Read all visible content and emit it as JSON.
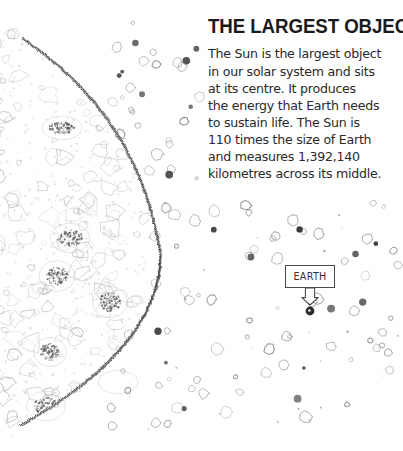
{
  "page": {
    "background_color": "#ffffff",
    "width": 403,
    "height": 451
  },
  "article": {
    "headline": "THE LARGEST OBJECT",
    "body": "The Sun is the largest object\nin our solar system and sits\nat its centre. It produces\nthe energy that Earth needs\nto sustain life. The Sun is\n110 times the size of Earth\nand measures 1,392,140\nkilometres across its middle.",
    "body_lines": [
      "The Sun is the largest object",
      "in our solar system and sits",
      "at its centre. It produces",
      "the energy that Earth needs",
      "to sustain life. The Sun is",
      "110 times the size of Earth",
      "and measures 1,392,140",
      "kilometres across its middle."
    ],
    "facts": {
      "size_vs_earth": "110 times the size of Earth",
      "diameter_km": "1,392,140",
      "diameter_unit": "kilometres"
    },
    "text_color": "#2a2a2a",
    "headline_color": "#1b1b1b"
  },
  "illustration": {
    "type": "hand-drawn-astronomy-diagram",
    "sun": {
      "label": "sun",
      "description": "large cropped sphere at left edge with wavy flame-like limb and stippled surface texture",
      "limb_color": "#3d3d3d",
      "texture_color": "#b9b9b9",
      "sunspot_color": "#555555",
      "arc_start": [
        22,
        38
      ],
      "arc_apex": [
        161,
        256
      ],
      "arc_end": [
        20,
        426
      ]
    },
    "starfield": {
      "label": "starfield",
      "description": "scattered hand-drawn hollow and filled circles of varying size",
      "hollow_color": "#8a8a8a",
      "filled_color": "#3a3a3a",
      "count": 132,
      "bounds": [
        150,
        20,
        400,
        432
      ]
    }
  },
  "callout": {
    "label_text": "EARTH",
    "border_color": "#4a4a4a",
    "text_color": "#333333",
    "box": {
      "x": 285,
      "y": 265,
      "width": 50,
      "height": 23
    },
    "arrow": {
      "direction": "down",
      "style": "hollow-outline",
      "from": [
        310,
        288
      ],
      "to": [
        310,
        305
      ],
      "color": "#4a4a4a"
    },
    "target": {
      "name": "earth-dot",
      "x": 310,
      "y": 311,
      "radius": 4.4,
      "color": "#2b2b2b"
    }
  }
}
